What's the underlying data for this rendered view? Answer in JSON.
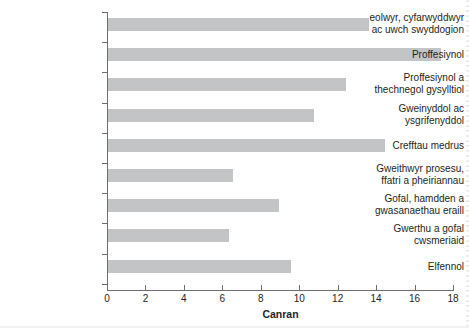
{
  "chart_data": {
    "type": "bar",
    "orientation": "horizontal",
    "title": "",
    "xlabel": "Canran",
    "ylabel": "",
    "xlim": [
      0,
      18
    ],
    "xticks": [
      0,
      2,
      4,
      6,
      8,
      10,
      12,
      14,
      16,
      18
    ],
    "grid": false,
    "legend": null,
    "bar_color": "#c3c4c6",
    "axis_color": "#6d6e71",
    "categories": [
      "eolwyr, cyfarwyddwyr ac uwch swyddogion",
      "Proffesiynol",
      "Proffesiynol a thechnegol gysylltiol",
      "Gweinyddol ac ysgrifenyddol",
      "Crefftau medrus",
      "Gweithwyr prosesu, ffatri a pheiriannau",
      "Gofal, hamdden a gwasanaethau eraill",
      "Gwerthu a gofal cwsmeriaid",
      "Elfennol"
    ],
    "values": [
      13.6,
      17.3,
      12.4,
      10.7,
      14.4,
      6.5,
      8.9,
      6.3,
      9.5
    ]
  },
  "axis": {
    "x_title": "Canran",
    "tick_labels": [
      "0",
      "2",
      "4",
      "6",
      "8",
      "10",
      "12",
      "14",
      "16",
      "18"
    ]
  },
  "category_labels": [
    {
      "line1": "eolwyr, cyfarwyddwyr",
      "line2": "ac uwch swyddogion"
    },
    {
      "line1": "Proffesiynol",
      "line2": ""
    },
    {
      "line1": "Proffesiynol a",
      "line2": "thechnegol gysylltiol"
    },
    {
      "line1": "Gweinyddol ac",
      "line2": "ysgrifenyddol"
    },
    {
      "line1": "Crefftau medrus",
      "line2": ""
    },
    {
      "line1": "Gweithwyr prosesu,",
      "line2": "ffatri a pheiriannau"
    },
    {
      "line1": "Gofal, hamdden a",
      "line2": "gwasanaethau eraill"
    },
    {
      "line1": "Gwerthu a gofal",
      "line2": "cwsmeriaid"
    },
    {
      "line1": "Elfennol",
      "line2": ""
    }
  ]
}
